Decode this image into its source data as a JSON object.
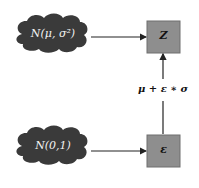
{
  "diagram": {
    "nodes": {
      "prior_cloud": {
        "label": "N(μ, σ²)",
        "shape": "cloud",
        "fill": "#3a3a3a"
      },
      "noise_cloud": {
        "label": "N(0,1)",
        "shape": "cloud",
        "fill": "#3a3a3a"
      },
      "z_box": {
        "label": "Z",
        "shape": "box",
        "fill": "#8e8e8e"
      },
      "epsilon_box": {
        "label": "ε",
        "shape": "box",
        "fill": "#8e8e8e"
      }
    },
    "edges": [
      {
        "from": "prior_cloud",
        "to": "z_box"
      },
      {
        "from": "noise_cloud",
        "to": "epsilon_box"
      },
      {
        "from": "epsilon_box",
        "to": "z_box",
        "label": "μ + ε ∗ σ"
      }
    ],
    "reparam_label": "μ + ε ∗ σ"
  }
}
